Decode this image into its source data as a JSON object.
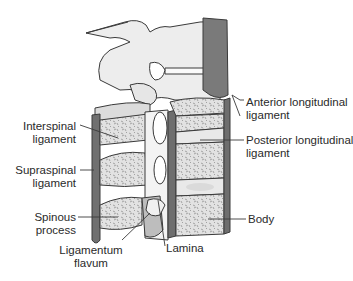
{
  "figure": {
    "type": "anatomical-diagram"
  },
  "labels": {
    "anterior_longitudinal": {
      "line1": "Anterior longitudinal",
      "line2": "ligament"
    },
    "posterior_longitudinal": {
      "line1": "Posterior longitudinal",
      "line2": "ligament"
    },
    "interspinal": {
      "line1": "Interspinal",
      "line2": "ligament"
    },
    "supraspinal": {
      "line1": "Supraspinal",
      "line2": "ligament"
    },
    "spinous": {
      "line1": "Spinous",
      "line2": "process"
    },
    "ligamentum_flavum": {
      "line1": "Ligamentum",
      "line2": "flavum"
    },
    "lamina": {
      "line1": "Lamina"
    },
    "body": {
      "line1": "Body"
    }
  },
  "colors": {
    "ligament_dark": "#6e6e6e",
    "bone_fill": "#d9d9d9",
    "bone_light": "#efefef",
    "outline": "#3a3a3a",
    "text": "#2a2a2a"
  }
}
